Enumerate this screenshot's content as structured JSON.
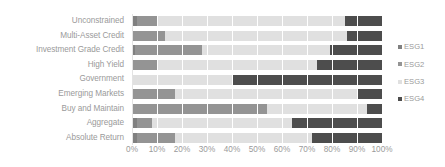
{
  "chart_data": {
    "type": "bar",
    "orientation": "horizontal",
    "stacked": true,
    "normalized": true,
    "title": "",
    "subtitle": "",
    "xlabel": "",
    "ylabel": "",
    "xlim": [
      0,
      100
    ],
    "grid": true,
    "legend_position": "right",
    "categories": [
      "Unconstrained",
      "Multi-Asset Credit",
      "Investment Grade Credit",
      "High Yield",
      "Government",
      "Emerging Markets",
      "Buy and Maintain",
      "Aggregate",
      "Absolute Return"
    ],
    "xticks": [
      0,
      10,
      20,
      30,
      40,
      50,
      60,
      70,
      80,
      90,
      100
    ],
    "xtick_labels": [
      "0%",
      "10%",
      "20%",
      "30%",
      "40%",
      "50%",
      "60%",
      "70%",
      "80%",
      "90%",
      "100%"
    ],
    "series": [
      {
        "name": "ESG1",
        "color": "#808080",
        "values": [
          2,
          0,
          1,
          0,
          0,
          0,
          0,
          2,
          2
        ]
      },
      {
        "name": "ESG2",
        "color": "#949494",
        "values": [
          8,
          13,
          27,
          10,
          0,
          17,
          54,
          6,
          15
        ]
      },
      {
        "name": "ESG3",
        "color": "#e0e0e0",
        "values": [
          75,
          73,
          51,
          64,
          40,
          73,
          40,
          56,
          55
        ]
      },
      {
        "name": "ESG4",
        "color": "#4d4d4d",
        "values": [
          15,
          14,
          21,
          26,
          60,
          10,
          6,
          36,
          28
        ]
      }
    ]
  },
  "legend": {
    "items": [
      {
        "label": "ESG1",
        "color": "#808080"
      },
      {
        "label": "ESG2",
        "color": "#949494"
      },
      {
        "label": "ESG3",
        "color": "#e0e0e0"
      },
      {
        "label": "ESG4",
        "color": "#4d4d4d"
      }
    ]
  },
  "colors": {
    "axis_text": "#9a9a9a",
    "gridline": "#ffffff",
    "plot_background": "#ffffff"
  }
}
